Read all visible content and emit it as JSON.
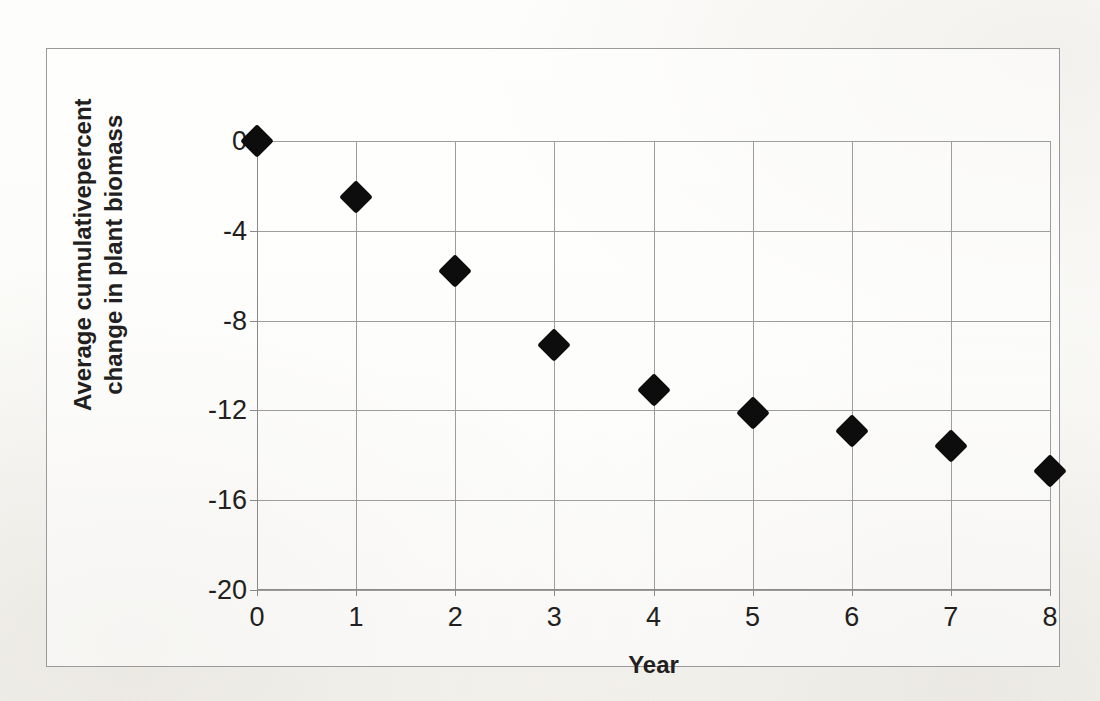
{
  "chart_data": {
    "type": "scatter",
    "title": "",
    "xlabel": "Year",
    "ylabel": "Average cumulativepercent change in plant biomass",
    "ylabel_lines": [
      "Average cumulativepercent",
      "change in plant biomass"
    ],
    "x": [
      0,
      1,
      2,
      3,
      4,
      5,
      6,
      7,
      8
    ],
    "values": [
      0,
      -2.5,
      -5.8,
      -9.1,
      -11.1,
      -12.1,
      -12.9,
      -13.6,
      -14.7
    ],
    "series": [
      {
        "name": "Average cumulative percent change in plant biomass",
        "values": [
          0,
          -2.5,
          -5.8,
          -9.1,
          -11.1,
          -12.1,
          -12.9,
          -13.6,
          -14.7
        ]
      }
    ],
    "xlim": [
      0,
      8
    ],
    "ylim": [
      -20,
      0
    ],
    "xticks": [
      0,
      1,
      2,
      3,
      4,
      5,
      6,
      7,
      8
    ],
    "xtick_labels": [
      "0",
      "1",
      "2",
      "3",
      "4",
      "5",
      "6",
      "7",
      "8"
    ],
    "yticks": [
      0,
      -4,
      -8,
      -12,
      -16,
      -20
    ],
    "ytick_labels": [
      "0",
      "-4",
      "-8",
      "-12",
      "-16",
      "-20"
    ],
    "grid": true,
    "grid_axis": "both",
    "legend": false,
    "legend_position": "none",
    "marker": "diamond",
    "marker_color": "#0d0d0d",
    "gridline_color": "#9d9d9d",
    "axis_color": "#8a8a8a",
    "plot_background": "#ffffff"
  },
  "page": {
    "background_color": "#fdfdfb",
    "border_color": "#9a9a9a"
  }
}
